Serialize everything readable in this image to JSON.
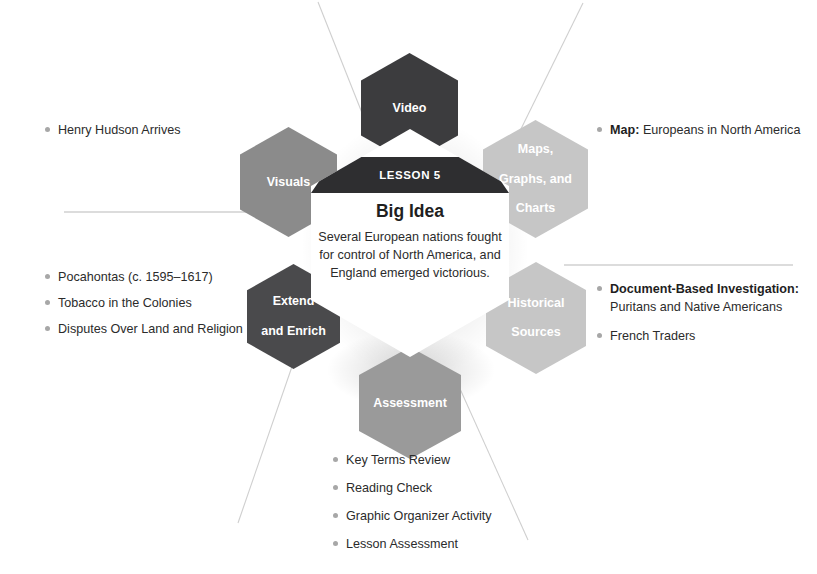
{
  "diagram": {
    "type": "hexagon-spoke-graphic-organizer",
    "center": {
      "eyebrow": "LESSON 5",
      "title": "Big Idea",
      "body": "Several European nations fought for control of North America, and England emerged victorious."
    },
    "nodes": [
      {
        "id": "video",
        "label": "Video",
        "tone": "dark",
        "color": "#3c3c3e"
      },
      {
        "id": "visuals",
        "label": "Visuals",
        "tone": "mid",
        "color": "#8b8b8b"
      },
      {
        "id": "maps",
        "label": "Maps,\nGraphs, and\nCharts",
        "tone": "light",
        "color": "#c6c6c6"
      },
      {
        "id": "extend",
        "label": "Extend\nand Enrich",
        "tone": "dark",
        "color": "#4a4a4c"
      },
      {
        "id": "historical",
        "label": "Historical\nSources",
        "tone": "light",
        "color": "#c6c6c6"
      },
      {
        "id": "assessment",
        "label": "Assessment",
        "tone": "mid",
        "color": "#9a9a9a"
      }
    ],
    "lists": {
      "visuals": [
        {
          "lead": "",
          "text": "Henry Hudson Arrives"
        }
      ],
      "extend": [
        {
          "lead": "",
          "text": "Pocahontas (c. 1595–1617)"
        },
        {
          "lead": "",
          "text": "Tobacco in the Colonies"
        },
        {
          "lead": "",
          "text": "Disputes Over Land and Religion"
        }
      ],
      "maps": [
        {
          "lead": "Map:",
          "text": "Europeans in North America"
        }
      ],
      "historical": [
        {
          "lead": "Document-Based Investigation:",
          "text": "",
          "sub": "Puritans and Native Americans"
        },
        {
          "lead": "",
          "text": "French Traders"
        }
      ],
      "assessment": [
        {
          "lead": "",
          "text": "Key Terms Review"
        },
        {
          "lead": "",
          "text": "Reading Check"
        },
        {
          "lead": "",
          "text": "Graphic Organizer Activity"
        },
        {
          "lead": "",
          "text": "Lesson Assessment"
        }
      ]
    }
  },
  "labels": {
    "video": "Video",
    "visuals": "Visuals",
    "maps_line1": "Maps,",
    "maps_line2": "Graphs, and",
    "maps_line3": "Charts",
    "extend_line1": "Extend",
    "extend_line2": "and Enrich",
    "historical_line1": "Historical",
    "historical_line2": "Sources",
    "assessment": "Assessment"
  },
  "bullets": {
    "visuals": {
      "b0": "Henry Hudson Arrives"
    },
    "extend": {
      "b0": "Pocahontas (c. 1595–1617)",
      "b1": "Tobacco in the Colonies",
      "b2": "Disputes Over Land and Religion"
    },
    "maps": {
      "b0_lead": "Map:",
      "b0_text": " Europeans in North America"
    },
    "historical": {
      "b0_lead": "Document-Based Investigation:",
      "b0_sub": "Puritans and Native Americans",
      "b1": "French Traders"
    },
    "assessment": {
      "b0": "Key Terms Review",
      "b1": "Reading Check",
      "b2": "Graphic Organizer Activity",
      "b3": "Lesson Assessment"
    }
  }
}
